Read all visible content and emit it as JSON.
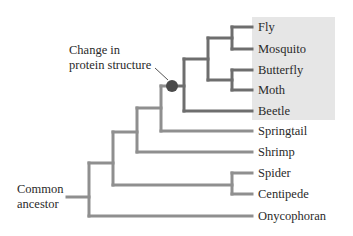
{
  "annotation": {
    "line1": "Change in",
    "line2": "protein structure"
  },
  "root": {
    "line1": "Common",
    "line2": "ancestor"
  },
  "highlight_group": [
    "Fly",
    "Mosquito",
    "Butterfly",
    "Moth",
    "Beetle"
  ],
  "taxa": [
    {
      "name": "Fly",
      "y": 27
    },
    {
      "name": "Mosquito",
      "y": 49
    },
    {
      "name": "Butterfly",
      "y": 70
    },
    {
      "name": "Moth",
      "y": 90
    },
    {
      "name": "Beetle",
      "y": 111
    },
    {
      "name": "Springtail",
      "y": 131
    },
    {
      "name": "Shrimp",
      "y": 152
    },
    {
      "name": "Spider",
      "y": 173
    },
    {
      "name": "Centipede",
      "y": 194
    },
    {
      "name": "Onycophoran",
      "y": 216
    }
  ],
  "colors": {
    "branch": "#8f8f8f",
    "highlight_branch": "#6e6e6e",
    "highlight_bg": "#e6e6e6",
    "marker": "#4a4a4a",
    "text": "#2a2a2a"
  }
}
